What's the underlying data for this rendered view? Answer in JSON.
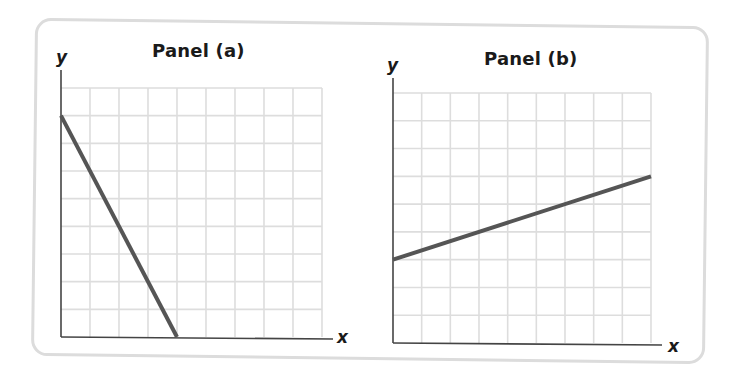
{
  "panels": [
    {
      "id": "a",
      "title": "Panel (a)",
      "x_label": "x",
      "y_label": "y"
    },
    {
      "id": "b",
      "title": "Panel (b)",
      "x_label": "x",
      "y_label": "y"
    }
  ],
  "colors": {
    "line": "#555555",
    "axis": "#444444",
    "grid": "#dddddd",
    "frame": "#dcdcdc"
  },
  "chart_data": [
    {
      "type": "line",
      "title": "Panel (a)",
      "xlabel": "x",
      "ylabel": "y",
      "xlim": [
        0,
        9
      ],
      "ylim": [
        0,
        9
      ],
      "grid": true,
      "grid_cells": [
        9,
        9
      ],
      "tick_labels": false,
      "series": [
        {
          "name": "line",
          "x": [
            0,
            4
          ],
          "y": [
            8,
            0
          ]
        }
      ]
    },
    {
      "type": "line",
      "title": "Panel (b)",
      "xlabel": "x",
      "ylabel": "y",
      "xlim": [
        0,
        9
      ],
      "ylim": [
        0,
        9
      ],
      "grid": true,
      "grid_cells": [
        9,
        9
      ],
      "tick_labels": false,
      "series": [
        {
          "name": "line",
          "x": [
            0,
            9
          ],
          "y": [
            3,
            6
          ]
        }
      ]
    }
  ]
}
